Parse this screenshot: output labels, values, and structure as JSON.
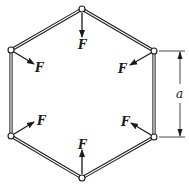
{
  "diagram": {
    "force_label": "F",
    "dimension_label": "a",
    "colors": {
      "line": "#1a1a1a",
      "member_fill": "#ffffff",
      "background": "#ffffff"
    },
    "joints": [
      {
        "id": "top",
        "x": 82,
        "y": 9
      },
      {
        "id": "upper-left",
        "x": 11,
        "y": 50
      },
      {
        "id": "upper-right",
        "x": 154,
        "y": 51
      },
      {
        "id": "lower-left",
        "x": 11,
        "y": 136
      },
      {
        "id": "lower-right",
        "x": 154,
        "y": 137
      },
      {
        "id": "bottom",
        "x": 82,
        "y": 178
      }
    ],
    "forces": [
      {
        "joint": "top",
        "label": "F"
      },
      {
        "joint": "upper-left",
        "label": "F"
      },
      {
        "joint": "upper-right",
        "label": "F"
      },
      {
        "joint": "lower-left",
        "label": "F"
      },
      {
        "joint": "lower-right",
        "label": "F"
      },
      {
        "joint": "bottom",
        "label": "F"
      }
    ]
  }
}
